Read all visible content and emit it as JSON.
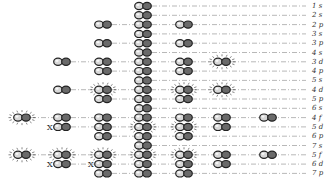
{
  "diagram": {
    "type": "orbital-energy-levels",
    "colors": {
      "line": "#888888",
      "outline": "#222222",
      "light_fill": "#d8d8d8",
      "dark_fill": "#6a6a6a",
      "glow": "#333333"
    },
    "columns_x": [
      22,
      62,
      103,
      143,
      184,
      222,
      268
    ],
    "center_column_index": 3,
    "row_start_y": 6,
    "row_pitch": 9.3,
    "label_x": 312,
    "rows": [
      {
        "label": "1 s",
        "pairs": [
          3
        ],
        "glow": [],
        "x_marks": []
      },
      {
        "label": "2 s",
        "pairs": [
          3
        ],
        "glow": [],
        "x_marks": []
      },
      {
        "label": "2 p",
        "pairs": [
          2,
          3,
          4
        ],
        "glow": [],
        "x_marks": []
      },
      {
        "label": "3 s",
        "pairs": [
          3
        ],
        "glow": [],
        "x_marks": []
      },
      {
        "label": "3 p",
        "pairs": [
          2,
          3,
          4
        ],
        "glow": [],
        "x_marks": []
      },
      {
        "label": "4 s",
        "pairs": [
          3
        ],
        "glow": [],
        "x_marks": []
      },
      {
        "label": "3 d",
        "pairs": [
          1,
          2,
          3,
          4,
          5
        ],
        "glow": [
          5
        ],
        "x_marks": []
      },
      {
        "label": "4 p",
        "pairs": [
          2,
          3,
          4
        ],
        "glow": [],
        "x_marks": []
      },
      {
        "label": "5 s",
        "pairs": [
          3
        ],
        "glow": [],
        "x_marks": []
      },
      {
        "label": "4 d",
        "pairs": [
          1,
          2,
          3,
          4,
          5
        ],
        "glow": [
          2,
          4,
          5
        ],
        "x_marks": []
      },
      {
        "label": "5 p",
        "pairs": [
          2,
          3,
          4
        ],
        "glow": [],
        "x_marks": []
      },
      {
        "label": "6 s",
        "pairs": [
          3
        ],
        "glow": [],
        "x_marks": []
      },
      {
        "label": "4 f",
        "pairs": [
          0,
          1,
          2,
          3,
          4,
          5,
          6
        ],
        "glow": [
          0
        ],
        "x_marks": []
      },
      {
        "label": "5 d",
        "pairs": [
          1,
          2,
          3,
          4,
          5
        ],
        "glow": [
          3,
          4
        ],
        "x_marks": [
          1
        ]
      },
      {
        "label": "6 p",
        "pairs": [
          2,
          3,
          4
        ],
        "glow": [],
        "x_marks": []
      },
      {
        "label": "7 s",
        "pairs": [
          3
        ],
        "glow": [],
        "x_marks": []
      },
      {
        "label": "5 f",
        "pairs": [
          0,
          1,
          2,
          3,
          4,
          5,
          6
        ],
        "glow": [
          0,
          1,
          2,
          3,
          4
        ],
        "x_marks": []
      },
      {
        "label": "6 d",
        "pairs": [
          1,
          2,
          3,
          4,
          5
        ],
        "glow": [],
        "x_marks": [
          1,
          2
        ]
      },
      {
        "label": "7 p",
        "pairs": [
          2,
          3,
          4
        ],
        "glow": [],
        "x_marks": []
      }
    ],
    "x_mark_glyph": "X"
  }
}
